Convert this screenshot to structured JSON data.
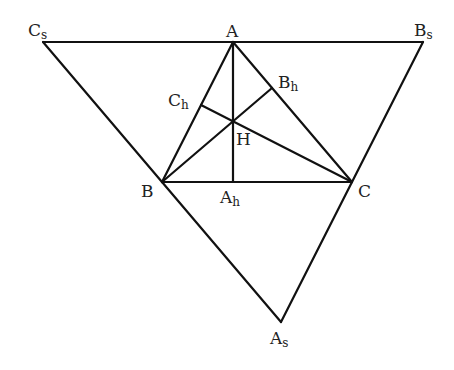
{
  "diagram": {
    "type": "geometry",
    "colors": {
      "line": "#111111",
      "text": "#222222",
      "background": "#ffffff"
    },
    "points": {
      "A": {
        "x": 233,
        "y": 42
      },
      "B": {
        "x": 162,
        "y": 182
      },
      "C": {
        "x": 352,
        "y": 182
      },
      "H": {
        "x": 233,
        "y": 122
      },
      "Ah": {
        "x": 233,
        "y": 182
      },
      "Bh": {
        "x": 272,
        "y": 88
      },
      "Ch": {
        "x": 201,
        "y": 105
      },
      "As": {
        "x": 281,
        "y": 322
      },
      "Bs": {
        "x": 423,
        "y": 42
      },
      "Cs": {
        "x": 43,
        "y": 42
      }
    },
    "labels": {
      "A": {
        "main": "A",
        "sub": ""
      },
      "B": {
        "main": "B",
        "sub": ""
      },
      "C": {
        "main": "C",
        "sub": ""
      },
      "H": {
        "main": "H",
        "sub": ""
      },
      "Ah": {
        "main": "A",
        "sub": "h"
      },
      "Bh": {
        "main": "B",
        "sub": "h"
      },
      "Ch": {
        "main": "C",
        "sub": "h"
      },
      "As": {
        "main": "A",
        "sub": "s"
      },
      "Bs": {
        "main": "B",
        "sub": "s"
      },
      "Cs": {
        "main": "C",
        "sub": "s"
      }
    },
    "segments": [
      [
        "Cs",
        "Bs"
      ],
      [
        "Bs",
        "As"
      ],
      [
        "As",
        "Cs"
      ],
      [
        "A",
        "B"
      ],
      [
        "B",
        "C"
      ],
      [
        "C",
        "A"
      ],
      [
        "A",
        "Ah"
      ],
      [
        "B",
        "Bh"
      ],
      [
        "C",
        "Ch"
      ]
    ]
  }
}
